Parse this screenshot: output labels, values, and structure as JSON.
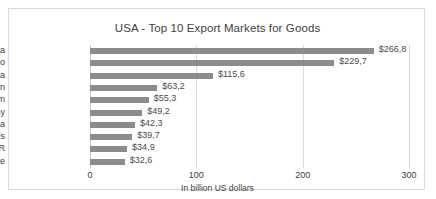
{
  "chart_data": {
    "type": "bar",
    "orientation": "horizontal",
    "title": "USA - Top 10 Export Markets for Goods",
    "xlabel": "In billion US dollars",
    "ylabel": "",
    "xlim": [
      0,
      300
    ],
    "xticks": [
      0,
      100,
      200,
      300
    ],
    "xtick_labels": [
      "0",
      "100",
      "200",
      "300"
    ],
    "grid": true,
    "legend": false,
    "bar_color": "#8c8c8c",
    "categories": [
      "Canada",
      "Mexico",
      "China",
      "Japan",
      "United Kingdom",
      "Germany",
      "Rep. of Korea",
      "Netherlands",
      "Hong Kong SAR",
      "France"
    ],
    "values": [
      266.8,
      229.7,
      115.6,
      63.2,
      55.3,
      49.2,
      42.3,
      39.7,
      34.9,
      32.6
    ],
    "data_labels": [
      "$266,8",
      "$229,7",
      "$115,6",
      "$63,2",
      "$55,3",
      "$49,2",
      "$42,3",
      "$39,7",
      "$34,9",
      "$32,6"
    ]
  }
}
